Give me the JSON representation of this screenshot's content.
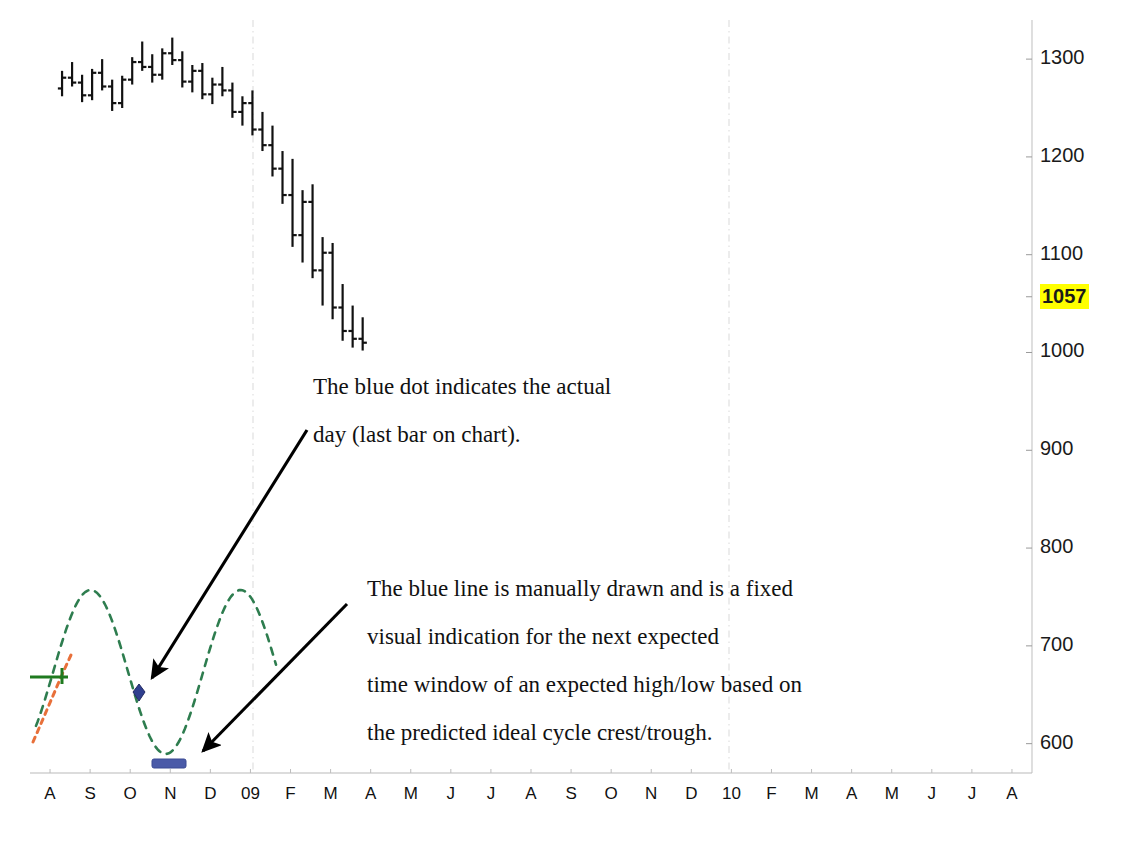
{
  "chart_data": {
    "type": "line",
    "title": "",
    "xlabel": "",
    "ylabel": "",
    "grid": false,
    "legend_position": "none",
    "ylim": [
      570,
      1340
    ],
    "yticks": [
      1300,
      1200,
      1100,
      1057,
      1000,
      900,
      800,
      700,
      600
    ],
    "ytick_labels": [
      "1300",
      "1200",
      "1100",
      "1057",
      "1000",
      "900",
      "800",
      "700",
      "600"
    ],
    "highlighted_ytick": "1057",
    "highlight_color": "#ffff00",
    "xtick_labels": [
      "A",
      "S",
      "O",
      "N",
      "D",
      "09",
      "F",
      "M",
      "A",
      "M",
      "J",
      "J",
      "A",
      "S",
      "O",
      "N",
      "D",
      "10",
      "F",
      "M",
      "A",
      "M",
      "J",
      "J",
      "A"
    ],
    "year_gridlines": [
      "09",
      "10"
    ],
    "series": [
      {
        "name": "price-ohlc-bars",
        "type": "ohlc",
        "color": "#111111",
        "note": "daily price bars, Aug 2008 through Dec 2008 decline",
        "points": [
          {
            "x": 0.3,
            "open": 1270,
            "high": 1288,
            "low": 1262,
            "close": 1281
          },
          {
            "x": 0.55,
            "open": 1281,
            "high": 1297,
            "low": 1272,
            "close": 1276
          },
          {
            "x": 0.8,
            "open": 1276,
            "high": 1284,
            "low": 1256,
            "close": 1263
          },
          {
            "x": 1.05,
            "open": 1263,
            "high": 1290,
            "low": 1258,
            "close": 1286
          },
          {
            "x": 1.3,
            "open": 1286,
            "high": 1300,
            "low": 1268,
            "close": 1272
          },
          {
            "x": 1.55,
            "open": 1272,
            "high": 1279,
            "low": 1247,
            "close": 1255
          },
          {
            "x": 1.8,
            "open": 1255,
            "high": 1283,
            "low": 1250,
            "close": 1279
          },
          {
            "x": 2.05,
            "open": 1279,
            "high": 1302,
            "low": 1274,
            "close": 1297
          },
          {
            "x": 2.3,
            "open": 1297,
            "high": 1318,
            "low": 1288,
            "close": 1292
          },
          {
            "x": 2.55,
            "open": 1292,
            "high": 1305,
            "low": 1276,
            "close": 1284
          },
          {
            "x": 2.8,
            "open": 1284,
            "high": 1311,
            "low": 1279,
            "close": 1306
          },
          {
            "x": 3.05,
            "open": 1306,
            "high": 1322,
            "low": 1294,
            "close": 1299
          },
          {
            "x": 3.3,
            "open": 1299,
            "high": 1308,
            "low": 1271,
            "close": 1277
          },
          {
            "x": 3.55,
            "open": 1277,
            "high": 1294,
            "low": 1266,
            "close": 1288
          },
          {
            "x": 3.8,
            "open": 1288,
            "high": 1296,
            "low": 1259,
            "close": 1264
          },
          {
            "x": 4.05,
            "open": 1264,
            "high": 1281,
            "low": 1254,
            "close": 1274
          },
          {
            "x": 4.3,
            "open": 1274,
            "high": 1292,
            "low": 1262,
            "close": 1268
          },
          {
            "x": 4.55,
            "open": 1268,
            "high": 1276,
            "low": 1240,
            "close": 1246
          },
          {
            "x": 4.8,
            "open": 1246,
            "high": 1262,
            "low": 1232,
            "close": 1255
          },
          {
            "x": 5.05,
            "open": 1255,
            "high": 1268,
            "low": 1222,
            "close": 1228
          },
          {
            "x": 5.3,
            "open": 1228,
            "high": 1246,
            "low": 1206,
            "close": 1212
          },
          {
            "x": 5.55,
            "open": 1212,
            "high": 1232,
            "low": 1180,
            "close": 1188
          },
          {
            "x": 5.8,
            "open": 1188,
            "high": 1206,
            "low": 1152,
            "close": 1161
          },
          {
            "x": 6.05,
            "open": 1161,
            "high": 1198,
            "low": 1108,
            "close": 1120
          },
          {
            "x": 6.3,
            "open": 1120,
            "high": 1166,
            "low": 1092,
            "close": 1154
          },
          {
            "x": 6.55,
            "open": 1154,
            "high": 1172,
            "low": 1076,
            "close": 1084
          },
          {
            "x": 6.8,
            "open": 1084,
            "high": 1118,
            "low": 1048,
            "close": 1102
          },
          {
            "x": 7.05,
            "open": 1102,
            "high": 1112,
            "low": 1034,
            "close": 1046
          },
          {
            "x": 7.3,
            "open": 1046,
            "high": 1070,
            "low": 1012,
            "close": 1022
          },
          {
            "x": 7.55,
            "open": 1022,
            "high": 1048,
            "low": 1005,
            "close": 1014
          },
          {
            "x": 7.8,
            "open": 1014,
            "high": 1036,
            "low": 1002,
            "close": 1010
          }
        ]
      },
      {
        "name": "ideal-cycle-wave",
        "type": "dashed-sine",
        "color": "#2e7d4f",
        "style": "dashed",
        "note": "predicted ideal cycle crest/trough curve"
      },
      {
        "name": "left-trend-marker",
        "type": "dashed-diagonal",
        "color": "#e8703a",
        "style": "dashed"
      },
      {
        "name": "left-level-marker",
        "type": "horizontal-line",
        "color": "#1f7a1f"
      }
    ],
    "markers": [
      {
        "name": "actual-day-dot",
        "shape": "diamond",
        "color": "#2f3f8f",
        "label": "blue dot"
      },
      {
        "name": "expected-window-bar",
        "shape": "thick-bar",
        "color": "#4a5aa8",
        "label": "blue line"
      }
    ]
  },
  "annotations": [
    {
      "name": "blue-dot-annotation",
      "lines": [
        "The blue dot indicates the actual",
        "day (last bar on chart)."
      ]
    },
    {
      "name": "blue-line-annotation",
      "lines": [
        "The blue line is manually drawn and is a fixed",
        "visual indication for the next expected",
        "time window of an expected high/low based on",
        "the predicted ideal cycle crest/trough."
      ]
    }
  ],
  "arrows": [
    {
      "name": "arrow-to-blue-dot",
      "from": [
        307,
        430
      ],
      "to": [
        152,
        678
      ]
    },
    {
      "name": "arrow-to-blue-line",
      "from": [
        347,
        604
      ],
      "to": [
        203,
        751
      ]
    }
  ]
}
